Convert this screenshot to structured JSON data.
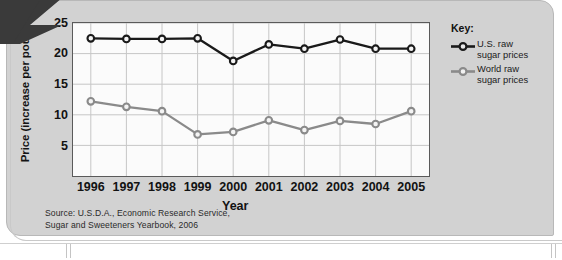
{
  "chart_data": {
    "type": "line",
    "title": "",
    "xlabel": "Year",
    "ylabel": "Price (increase per pound)",
    "categories": [
      "1996",
      "1997",
      "1998",
      "1999",
      "2000",
      "2001",
      "2002",
      "2003",
      "2004",
      "2005"
    ],
    "x": [
      1996,
      1997,
      1998,
      1999,
      2000,
      2001,
      2002,
      2003,
      2004,
      2005
    ],
    "ylim": [
      0,
      25
    ],
    "yticks": [
      5,
      10,
      15,
      20,
      25
    ],
    "grid": true,
    "legend_position": "right",
    "series": [
      {
        "name": "U.S. raw sugar prices",
        "color": "#1a1a1a",
        "values": [
          22.5,
          22.4,
          22.4,
          22.5,
          18.8,
          21.5,
          20.8,
          22.3,
          20.8,
          20.8
        ]
      },
      {
        "name": "World raw sugar prices",
        "color": "#8a8a8a",
        "values": [
          12.2,
          11.3,
          10.6,
          6.8,
          7.2,
          9.1,
          7.5,
          9.0,
          8.5,
          10.6
        ]
      }
    ],
    "source_note": "Source: U.S.D.A., Economic Research Service, Sugar and Sweeteners Yearbook, 2006"
  },
  "axes": {
    "y_title": "Price (increase per pound)",
    "x_title": "Year",
    "y_tick_labels": [
      "25",
      "20",
      "15",
      "10",
      "5"
    ],
    "x_tick_labels": [
      "1996",
      "1997",
      "1998",
      "1999",
      "2000",
      "2001",
      "2002",
      "2003",
      "2004",
      "2005"
    ]
  },
  "legend": {
    "title": "Key:",
    "entries": [
      {
        "label_line1": "U.S. raw",
        "label_line2": "sugar prices",
        "color": "#1a1a1a"
      },
      {
        "label_line1": "World raw",
        "label_line2": "sugar prices",
        "color": "#8a8a8a"
      }
    ]
  },
  "source": {
    "line1": "Source: U.S.D.A., Economic Research Service,",
    "line2": "Sugar and Sweeteners Yearbook, 2006"
  },
  "colors": {
    "panel_bg": "#d2d2d2",
    "plot_bg": "#fbfbfb",
    "grid": "#c6c6c6",
    "frame": "#5a5a5a",
    "us_series": "#1a1a1a",
    "world_series": "#8a8a8a"
  }
}
